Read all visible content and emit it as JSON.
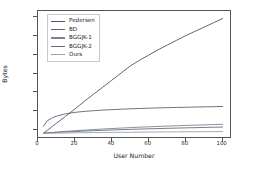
{
  "chart_data": {
    "type": "line",
    "title": "",
    "xlabel": "User Number",
    "ylabel": "Bytes",
    "xlim": [
      0,
      104
    ],
    "ylim_exp": [
      6.6,
      33.2
    ],
    "yscale": "log",
    "grid": false,
    "legend_position": "upper left",
    "xticks": [
      "0",
      "20",
      "40",
      "60",
      "80",
      "100"
    ],
    "xtick_values": [
      0,
      20,
      40,
      60,
      80,
      100
    ],
    "yticks": [
      {
        "base": "10",
        "exp": "8"
      },
      {
        "base": "10",
        "exp": "12"
      },
      {
        "base": "10",
        "exp": "16"
      },
      {
        "base": "10",
        "exp": "20"
      },
      {
        "base": "10",
        "exp": "24"
      },
      {
        "base": "10",
        "exp": "28"
      },
      {
        "base": "10",
        "exp": "32"
      }
    ],
    "ytick_exponents": [
      8,
      12,
      16,
      20,
      24,
      28,
      32
    ],
    "x": [
      3,
      5,
      8,
      10,
      15,
      20,
      25,
      30,
      35,
      40,
      45,
      50,
      55,
      60,
      65,
      70,
      75,
      80,
      85,
      90,
      95,
      100
    ],
    "series": [
      {
        "name": "Pedersen",
        "color": "#4c566a",
        "comment": "steep, near-linear on log axis: exponent grows ~0.3 per user",
        "values_log10": [
          7.4,
          8.0,
          8.9,
          9.5,
          11.0,
          12.5,
          14.1,
          15.6,
          17.1,
          18.6,
          20.1,
          21.6,
          22.8,
          23.9,
          25.0,
          26.0,
          27.0,
          28.0,
          28.9,
          29.8,
          30.7,
          31.6
        ]
      },
      {
        "name": "BD",
        "color": "#5a6472",
        "comment": "logarithmic growth, plateaus near 1e13",
        "values_log10": [
          8.9,
          10.0,
          10.7,
          11.0,
          11.5,
          11.8,
          12.0,
          12.15,
          12.28,
          12.38,
          12.47,
          12.55,
          12.62,
          12.68,
          12.74,
          12.79,
          12.84,
          12.88,
          12.92,
          12.96,
          13.0,
          13.05
        ]
      },
      {
        "name": "BGGJK-1",
        "color": "#7a8490",
        "comment": "low cluster, slow rise toward ~1e9.4",
        "values_log10": [
          7.45,
          7.5,
          7.58,
          7.64,
          7.78,
          7.92,
          8.05,
          8.17,
          8.28,
          8.39,
          8.49,
          8.58,
          8.67,
          8.75,
          8.83,
          8.9,
          8.97,
          9.04,
          9.1,
          9.16,
          9.22,
          9.28
        ]
      },
      {
        "name": "BGGJK-2",
        "color": "#646e7c",
        "comment": "low cluster, slightly below BGGJK-1",
        "values_log10": [
          7.42,
          7.46,
          7.52,
          7.56,
          7.66,
          7.76,
          7.85,
          7.93,
          8.01,
          8.08,
          8.15,
          8.21,
          8.27,
          8.33,
          8.38,
          8.43,
          8.48,
          8.53,
          8.57,
          8.62,
          8.66,
          8.7
        ]
      },
      {
        "name": "Ours",
        "color": "#9aa3ad",
        "comment": "flattest, nearly constant around 1e7.5",
        "values_log10": [
          7.38,
          7.39,
          7.41,
          7.42,
          7.45,
          7.48,
          7.5,
          7.53,
          7.55,
          7.57,
          7.59,
          7.61,
          7.63,
          7.64,
          7.66,
          7.67,
          7.69,
          7.7,
          7.71,
          7.73,
          7.74,
          7.75
        ]
      }
    ]
  }
}
